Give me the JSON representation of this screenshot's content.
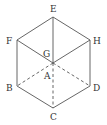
{
  "diagram": {
    "type": "cube-projection",
    "stroke_color": "#555555",
    "label_color": "#333333",
    "vertices": {
      "E": {
        "label": "E",
        "x": 53,
        "y": 17
      },
      "F": {
        "label": "F",
        "x": 17,
        "y": 40
      },
      "H": {
        "label": "H",
        "x": 90,
        "y": 40
      },
      "G": {
        "label": "G",
        "x": 53,
        "y": 63
      },
      "A": {
        "label": "A",
        "x": 53,
        "y": 63
      },
      "B": {
        "label": "B",
        "x": 17,
        "y": 86
      },
      "D": {
        "label": "D",
        "x": 90,
        "y": 86
      },
      "C": {
        "label": "C",
        "x": 53,
        "y": 108
      }
    },
    "solid_edges": [
      [
        "E",
        "F"
      ],
      [
        "E",
        "H"
      ],
      [
        "F",
        "B"
      ],
      [
        "H",
        "D"
      ],
      [
        "B",
        "C"
      ],
      [
        "D",
        "C"
      ],
      [
        "F",
        "G"
      ],
      [
        "H",
        "G"
      ],
      [
        "E",
        "G"
      ]
    ],
    "dashed_edges": [
      [
        "A",
        "B"
      ],
      [
        "A",
        "D"
      ],
      [
        "A",
        "C"
      ]
    ],
    "labels": {
      "E": "E",
      "F": "F",
      "G": "G",
      "H": "H",
      "A": "A",
      "B": "B",
      "C": "C",
      "D": "D"
    }
  }
}
